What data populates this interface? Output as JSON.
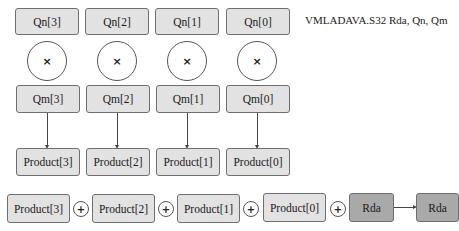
{
  "instruction": "VMLADAVA.S32 Rda, Qn, Qm",
  "qn_row": [
    "Qn[3]",
    "Qn[2]",
    "Qn[1]",
    "Qn[0]"
  ],
  "multiply_symbol": "×",
  "qm_row": [
    "Qm[3]",
    "Qm[2]",
    "Qm[1]",
    "Qm[0]"
  ],
  "product_row": [
    "Product[3]",
    "Product[2]",
    "Product[1]",
    "Product[0]"
  ],
  "sum_row": {
    "terms": [
      "Product[3]",
      "Product[2]",
      "Product[1]",
      "Product[0]",
      "Rda"
    ],
    "plus_symbol": "+",
    "result": "Rda"
  },
  "colors": {
    "light_box": "#e2e2e2",
    "dark_box": "#a9a9a9",
    "border": "#6e6e6e"
  }
}
